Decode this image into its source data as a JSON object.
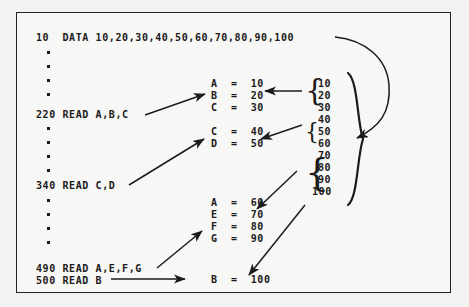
{
  "figure": {
    "background_color": "#f7f7f5",
    "border_color": "#222222",
    "text_color": "#1b1b1b"
  },
  "program": {
    "data_line": "10  DATA 10,20,30,40,50,60,70,80,90,100",
    "read_lines": [
      {
        "label": "220 READ A,B,C"
      },
      {
        "label": "340 READ C,D"
      },
      {
        "label": "490 READ A,E,F,G"
      },
      {
        "label": "500 READ B"
      }
    ],
    "ellipsis_groups": [
      {
        "dots": 4
      },
      {
        "dots": 4
      },
      {
        "dots": 4
      }
    ]
  },
  "assignments": {
    "group1": [
      {
        "var": "A",
        "eq": "=",
        "val": "10"
      },
      {
        "var": "B",
        "eq": "=",
        "val": "20"
      },
      {
        "var": "C",
        "eq": "=",
        "val": "30"
      }
    ],
    "group2": [
      {
        "var": "C",
        "eq": "=",
        "val": "40"
      },
      {
        "var": "D",
        "eq": "=",
        "val": "50"
      }
    ],
    "group3": [
      {
        "var": "A",
        "eq": "=",
        "val": "60"
      },
      {
        "var": "E",
        "eq": "=",
        "val": "70"
      },
      {
        "var": "F",
        "eq": "=",
        "val": "80"
      },
      {
        "var": "G",
        "eq": "=",
        "val": "90"
      }
    ],
    "group4": [
      {
        "var": "B",
        "eq": "=",
        "val": "100"
      }
    ]
  },
  "data_pool": {
    "values": [
      "10",
      "20",
      "30",
      "40",
      "50",
      "60",
      "70",
      "80",
      "90",
      "100"
    ],
    "groups": [
      {
        "brace": "{",
        "members": [
          "10",
          "20",
          "30"
        ]
      },
      {
        "brace": "{",
        "members": [
          "40",
          "50"
        ]
      },
      {
        "brace": "{",
        "members": [
          "60",
          "70",
          "80",
          "90"
        ]
      }
    ],
    "outer_brace": "}"
  },
  "arrows": {
    "items": [
      {
        "name": "data-line-to-pool-arc",
        "kind": "curved"
      },
      {
        "name": "read220-to-assign1",
        "kind": "straight"
      },
      {
        "name": "pool-group1-to-assign1",
        "kind": "straight"
      },
      {
        "name": "pool-group2-to-assign2",
        "kind": "straight"
      },
      {
        "name": "read340-to-assign2",
        "kind": "straight"
      },
      {
        "name": "pool-group3-to-assign3",
        "kind": "straight"
      },
      {
        "name": "read490-to-assign3",
        "kind": "straight"
      },
      {
        "name": "read500-to-assign4",
        "kind": "straight"
      },
      {
        "name": "pool-100-to-assign4",
        "kind": "straight"
      }
    ]
  }
}
